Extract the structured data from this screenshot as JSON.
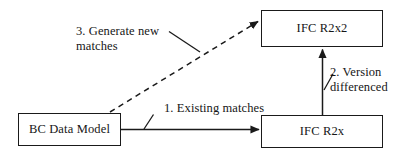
{
  "diagram": {
    "type": "flow-diagram",
    "background_color": "#ffffff",
    "stroke_color": "#1a1a1a",
    "text_color": "#161616",
    "nodes": [
      {
        "id": "bc-data-model",
        "label": "BC Data Model",
        "shape": "rectangle",
        "x": 18,
        "y": 113,
        "width": 103,
        "height": 33
      },
      {
        "id": "ifc-r2x2",
        "label": "IFC R2x2",
        "shape": "rectangle",
        "x": 261,
        "y": 10,
        "width": 122,
        "height": 37
      },
      {
        "id": "ifc-r2x",
        "label": "IFC R2x",
        "shape": "rectangle",
        "x": 261,
        "y": 115,
        "width": 122,
        "height": 33
      }
    ],
    "edges": [
      {
        "id": "existing-matches",
        "label": "1. Existing matches",
        "from": "bc-data-model",
        "to": "ifc-r2x",
        "style": "solid",
        "arrowhead": "filled-triangle",
        "direction": "right"
      },
      {
        "id": "version-differenced",
        "label": "2. Version\ndifferenced",
        "from": "ifc-r2x",
        "to": "ifc-r2x2",
        "style": "solid",
        "arrowhead": "filled-triangle",
        "direction": "up"
      },
      {
        "id": "generate-new-matches",
        "label": "3. Generate new\nmatches",
        "from": "bc-data-model",
        "to": "ifc-r2x2",
        "style": "dashed",
        "arrowhead": "filled-triangle",
        "direction": "up-right"
      }
    ]
  }
}
